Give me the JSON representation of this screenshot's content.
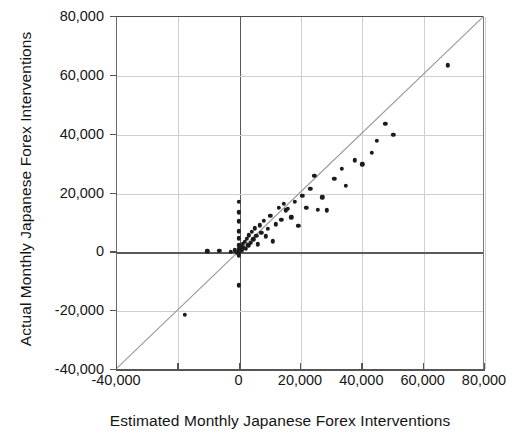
{
  "chart_data": {
    "type": "scatter",
    "title": "",
    "xlabel": "Estimated Monthly Japanese Forex Interventions",
    "ylabel": "Actual Monthly Japanese Forex Interventions",
    "xlim": [
      -40000,
      80000
    ],
    "ylim": [
      -40000,
      80000
    ],
    "xticks": [
      -40000,
      -20000,
      0,
      20000,
      40000,
      60000,
      80000
    ],
    "xticklabels": [
      "-40,000",
      "",
      "0",
      "20,000",
      "40,000",
      "60,000",
      "80,000"
    ],
    "yticks": [
      -40000,
      -20000,
      0,
      20000,
      40000,
      60000,
      80000
    ],
    "yticklabels": [
      "-40,000",
      "-20,000",
      "0",
      "20,000",
      "40,000",
      "60,000",
      "80,000"
    ],
    "grid": true,
    "legend": null,
    "reference_line": {
      "type": "identity",
      "label": "45-degree line",
      "from": [
        -40000,
        -40000
      ],
      "to": [
        80000,
        80000
      ],
      "color": "#9a9a9a"
    },
    "marker": {
      "shape": "circle",
      "color": "#1b1b1b",
      "size": 4.4
    },
    "points": [
      [
        -17500,
        -21500
      ],
      [
        -10200,
        0
      ],
      [
        -6300,
        100
      ],
      [
        -2500,
        -200
      ],
      [
        -1200,
        300
      ],
      [
        -600,
        -400
      ],
      [
        0,
        16900
      ],
      [
        0,
        13300
      ],
      [
        0,
        10200
      ],
      [
        0,
        6800
      ],
      [
        0,
        4400
      ],
      [
        0,
        2100
      ],
      [
        0,
        900
      ],
      [
        0,
        200
      ],
      [
        0,
        -500
      ],
      [
        0,
        -1300
      ],
      [
        0,
        -11600
      ],
      [
        600,
        700
      ],
      [
        900,
        1500
      ],
      [
        1100,
        300
      ],
      [
        1400,
        2600
      ],
      [
        1700,
        1200
      ],
      [
        2100,
        3300
      ],
      [
        2400,
        900
      ],
      [
        2700,
        4200
      ],
      [
        3100,
        2100
      ],
      [
        3400,
        5400
      ],
      [
        3900,
        3000
      ],
      [
        4300,
        6600
      ],
      [
        4800,
        4100
      ],
      [
        5200,
        7800
      ],
      [
        5800,
        5200
      ],
      [
        6200,
        2400
      ],
      [
        6900,
        8900
      ],
      [
        7400,
        6300
      ],
      [
        8100,
        10400
      ],
      [
        8800,
        5100
      ],
      [
        9600,
        7600
      ],
      [
        10300,
        12100
      ],
      [
        11200,
        3400
      ],
      [
        12100,
        9200
      ],
      [
        13000,
        14800
      ],
      [
        13900,
        10800
      ],
      [
        14800,
        16200
      ],
      [
        15400,
        13900
      ],
      [
        16100,
        14400
      ],
      [
        17200,
        11600
      ],
      [
        18300,
        16800
      ],
      [
        19400,
        8700
      ],
      [
        20800,
        18900
      ],
      [
        22100,
        14900
      ],
      [
        23400,
        21300
      ],
      [
        24700,
        25600
      ],
      [
        25900,
        14100
      ],
      [
        27300,
        18400
      ],
      [
        28800,
        14000
      ],
      [
        31200,
        24600
      ],
      [
        33600,
        28100
      ],
      [
        34900,
        22200
      ],
      [
        37800,
        30900
      ],
      [
        40300,
        29600
      ],
      [
        43500,
        33400
      ],
      [
        45100,
        37500
      ],
      [
        47800,
        43300
      ],
      [
        50400,
        39600
      ],
      [
        68200,
        63200
      ]
    ]
  },
  "axis": {
    "xlabel": "Estimated Monthly Japanese Forex Interventions",
    "ylabel": "Actual Monthly Japanese Forex Interventions"
  }
}
